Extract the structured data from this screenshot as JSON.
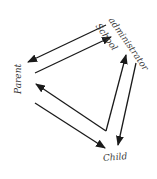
{
  "diagram": {
    "nodes": {
      "school_line1": "School",
      "school_line2": "administrator",
      "parent": "Parent",
      "child": "Child"
    },
    "edges": [
      {
        "from": "School administrator",
        "to": "Parent"
      },
      {
        "from": "Parent",
        "to": "School administrator"
      },
      {
        "from": "Child",
        "to": "Parent"
      },
      {
        "from": "Child",
        "to": "School administrator"
      },
      {
        "from": "School administrator",
        "to": "Child"
      },
      {
        "from": "Parent",
        "to": "Child"
      }
    ],
    "colors": {
      "line": "#1a1a1a",
      "text": "#3a3a3a",
      "background": "#ffffff"
    }
  }
}
